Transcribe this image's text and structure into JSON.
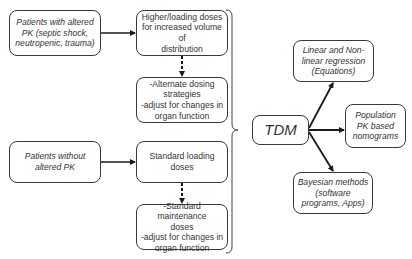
{
  "diagram": {
    "patient_groups": [
      {
        "label": "Patients with altered\nPK (septic shock,\nneutropenic, trauma)",
        "loading": "Higher/loading doses\nfor increased volume of\ndistribution",
        "maintenance": "-Alternate dosing\nstrategies\n-adjust for changes in\norgan function"
      },
      {
        "label": "Patients without\naltered PK",
        "loading": "Standard loading doses",
        "maintenance": "-Standard maintenance\ndoses\n-adjust for changes in\norgan function"
      }
    ],
    "center": "TDM",
    "methods": [
      "Linear and Non-\nlinear regression\n(Equations)",
      "Population\nPK based\nnomograms",
      "Bayesian methods\n(software\nprograms, Apps)"
    ],
    "colors": {
      "stroke": "#1a1a1a",
      "box_border": "#3a3a3a",
      "text": "#333333"
    }
  }
}
